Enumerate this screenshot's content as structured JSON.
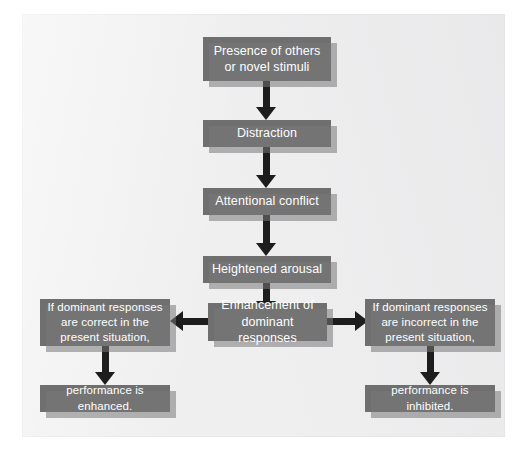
{
  "figure": {
    "type": "flowchart",
    "orientation": "top-down with two terminal branches",
    "background_color": "#efeff0",
    "node_color": "#6f6f6f",
    "node_text_color": "#ffffff",
    "connector_color": "#1d1d1d"
  },
  "nodes": {
    "presence": {
      "line1": "Presence of others",
      "line2": "or novel stimuli"
    },
    "distraction": {
      "line1": "Distraction"
    },
    "attentional_conflict": {
      "line1": "Attentional conflict"
    },
    "heightened_arousal": {
      "line1": "Heightened arousal"
    },
    "enhancement": {
      "line1": "Enhancement of",
      "line2": "dominant responses"
    },
    "left_condition": {
      "line1": "If dominant responses",
      "line2": "are correct in the",
      "line3": "present situation,"
    },
    "right_condition": {
      "line1": "If dominant responses",
      "line2": "are incorrect in the",
      "line3": "present situation,"
    },
    "left_outcome": {
      "line1": "performance is enhanced."
    },
    "right_outcome": {
      "line1": "performance is inhibited."
    }
  },
  "edges": [
    {
      "from": "presence",
      "to": "distraction",
      "direction": "down"
    },
    {
      "from": "distraction",
      "to": "attentional_conflict",
      "direction": "down"
    },
    {
      "from": "attentional_conflict",
      "to": "heightened_arousal",
      "direction": "down"
    },
    {
      "from": "heightened_arousal",
      "to": "enhancement",
      "direction": "down"
    },
    {
      "from": "enhancement",
      "to": "left_condition",
      "direction": "left"
    },
    {
      "from": "enhancement",
      "to": "right_condition",
      "direction": "right"
    },
    {
      "from": "left_condition",
      "to": "left_outcome",
      "direction": "down"
    },
    {
      "from": "right_condition",
      "to": "right_outcome",
      "direction": "down"
    }
  ]
}
